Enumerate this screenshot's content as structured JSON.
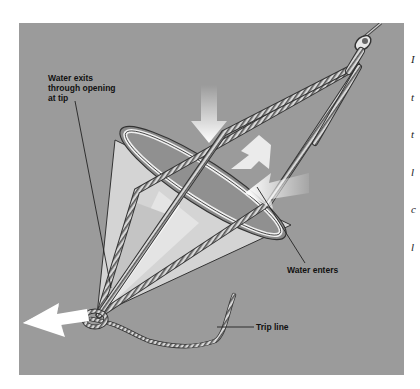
{
  "figure": {
    "background_color": "#9b9b9b",
    "arrow_color": "#ffffff",
    "labels": {
      "exit": "Water exits\nthrough opening\nat tip",
      "enter": "Water enters",
      "trip_line": "Trip line"
    },
    "icons": [
      "shackle-icon",
      "drogue-cone-icon",
      "rope-icon",
      "flow-arrow-icon"
    ]
  },
  "side_text": {
    "lines": [
      "I",
      "t",
      "t",
      "l",
      "c",
      "l"
    ]
  }
}
